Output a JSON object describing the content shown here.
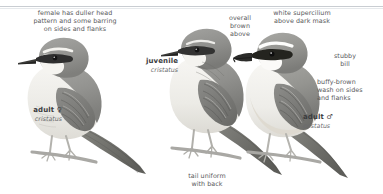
{
  "plate": {
    "width": 383,
    "height": 194,
    "background": "#ffffff",
    "subject": "Brown Shrike",
    "divider_color": "#c9cdd2"
  },
  "colors": {
    "note_text": "#58595b",
    "label_text": "#3b3c3e",
    "sci_text": "#6a6b6d",
    "plumage_upper": "#9a9a98",
    "plumage_upper_dark": "#7b7b7a",
    "plumage_under": "#efeeea",
    "mask": "#2e2e2e",
    "bill": "#3a3a38",
    "leg": "#bdbcb8",
    "perch": "#a9a8a4"
  },
  "notes": [
    {
      "name": "note-female-head",
      "text": "female has duller head\npattern and some barring\non sides and flanks",
      "align": "center",
      "x": 19,
      "y": 9,
      "w": 112
    },
    {
      "name": "note-overall-brown",
      "text": "overall\nbrown\nabove",
      "align": "center",
      "x": 219,
      "y": 14,
      "w": 42
    },
    {
      "name": "note-white-supercilium",
      "text": "white supercilium\nabove dark mask",
      "align": "center",
      "x": 256,
      "y": 9,
      "w": 92
    },
    {
      "name": "note-stubby-bill",
      "text": "stubby\nbill",
      "align": "center",
      "x": 320,
      "y": 52,
      "w": 50
    },
    {
      "name": "note-buffy-brown",
      "text": "buffy-brown\nwash on sides\nand flanks",
      "align": "left",
      "x": 317,
      "y": 78,
      "w": 66
    },
    {
      "name": "note-tail-uniform",
      "text": "tail uniform\nwith back",
      "align": "center",
      "x": 176,
      "y": 172,
      "w": 62
    }
  ],
  "labels": [
    {
      "name": "label-adult-female",
      "common": "adult ♀",
      "scientific": "cristatus",
      "align": "right",
      "x": 4,
      "y": 106,
      "w": 58
    },
    {
      "name": "label-juvenile",
      "common": "juvenile",
      "scientific": "cristatus",
      "align": "right",
      "x": 126,
      "y": 57,
      "w": 52
    },
    {
      "name": "label-adult-male",
      "common": "adult ♂",
      "scientific": "cristatus",
      "align": "left",
      "x": 303,
      "y": 113,
      "w": 58
    }
  ],
  "birds": [
    {
      "name": "bird-adult-female",
      "pose": "perched-left-facing",
      "x": 30,
      "y": 36
    },
    {
      "name": "bird-juvenile",
      "pose": "perched-left-facing",
      "x": 168,
      "y": 24
    },
    {
      "name": "bird-adult-male",
      "pose": "perched-left-facing",
      "x": 243,
      "y": 30
    }
  ]
}
